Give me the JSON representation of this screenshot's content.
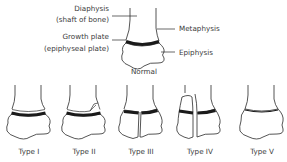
{
  "normal": {
    "caption": "Normal",
    "labels": {
      "diaphysis_line1": "Diaphysis",
      "diaphysis_line2": "(shaft of bone)",
      "growth_plate_line1": "Growth plate",
      "growth_plate_line2": "(epiphyseal plate)",
      "metaphysis": "Metaphysis",
      "epiphysis": "Epiphysis"
    }
  },
  "types": [
    {
      "label": "Type I",
      "description": "fracture through the growth plate"
    },
    {
      "label": "Type II",
      "description": "fracture through growth plate and metaphysis"
    },
    {
      "label": "Type III",
      "description": "fracture through growth plate and epiphysis"
    },
    {
      "label": "Type IV",
      "description": "fracture through metaphysis, growth plate and epiphysis"
    },
    {
      "label": "Type V",
      "description": "crush injury of the growth plate"
    }
  ],
  "colors": {
    "line": "#2a2a2a",
    "plate": "#1a1a1a",
    "text": "#3a3a3a",
    "background": "#ffffff"
  }
}
